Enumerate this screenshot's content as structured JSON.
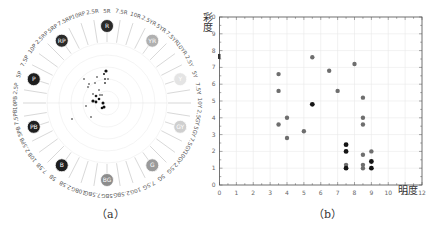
{
  "chart_data": [
    {
      "id": "a",
      "type": "polar-hue-chart",
      "caption": "（a）",
      "title": "Munsell hue ring",
      "hue_labels": [
        "5R",
        "7.5R",
        "10R",
        "2.5YR",
        "5YR",
        "7.5YR",
        "10YR",
        "2.5Y",
        "5Y",
        "7.5Y",
        "10Y",
        "2.5GY",
        "5GY",
        "7.5GY",
        "10GY",
        "2.5G",
        "5G",
        "7.5G",
        "10G",
        "2.5BG",
        "5BG",
        "7.5BG",
        "10BG",
        "2.5B",
        "5B",
        "7.5B",
        "10B",
        "2.5PB",
        "5PB",
        "7.5PB",
        "10PB",
        "2.5P",
        "5P",
        "7.5P",
        "10P",
        "2.5RP",
        "5RP",
        "7.5RP",
        "10RP",
        "2.5R"
      ],
      "hue_badges": [
        {
          "label": "R",
          "hue": "5R",
          "color": "#2a2a2a"
        },
        {
          "label": "YR",
          "hue": "5YR",
          "color": "#b0b0b0"
        },
        {
          "label": "Y",
          "hue": "5Y",
          "color": "#e4e4e4"
        },
        {
          "label": "GY",
          "hue": "5GY",
          "color": "#cfcfcf"
        },
        {
          "label": "G",
          "hue": "5G",
          "color": "#9a9a9a"
        },
        {
          "label": "BG",
          "hue": "5BG",
          "color": "#8c8c8c"
        },
        {
          "label": "B",
          "hue": "5B",
          "color": "#1e1e1e"
        },
        {
          "label": "PB",
          "hue": "5PB",
          "color": "#1e1e1e"
        },
        {
          "label": "P",
          "hue": "5P",
          "color": "#1e1e1e"
        },
        {
          "label": "RP",
          "hue": "5RP",
          "color": "#2a2a2a"
        }
      ],
      "rings": 5,
      "note": "Cluster of sample points near center, concentrated in the R / RP / YR direction"
    },
    {
      "id": "b",
      "type": "scatter",
      "caption": "（b）",
      "xlabel": "明度",
      "ylabel": "彩度",
      "xlim": [
        0,
        12
      ],
      "ylim": [
        0,
        10
      ],
      "xticks": [
        0,
        1,
        2,
        3,
        4,
        5,
        6,
        7,
        8,
        9,
        10,
        11,
        12
      ],
      "yticks": [
        0,
        1,
        2,
        3,
        4,
        5,
        6,
        7,
        8,
        9,
        10
      ],
      "grid": true,
      "series": [
        {
          "name": "gray",
          "color": "#6e6e6e",
          "points": [
            [
              3.5,
              6.6
            ],
            [
              3.5,
              5.6
            ],
            [
              3.5,
              3.6
            ],
            [
              4,
              4.0
            ],
            [
              4,
              2.8
            ],
            [
              5,
              3.2
            ],
            [
              5.5,
              7.6
            ],
            [
              6.5,
              6.8
            ],
            [
              7,
              5.6
            ],
            [
              8,
              7.2
            ],
            [
              8.5,
              5.2
            ],
            [
              8.5,
              4.0
            ],
            [
              8.5,
              3.6
            ],
            [
              8.5,
              1.8
            ],
            [
              8.5,
              1.2
            ],
            [
              8.5,
              1.0
            ],
            [
              9,
              2.0
            ],
            [
              7.5,
              1.2
            ]
          ]
        },
        {
          "name": "black",
          "color": "#151515",
          "points": [
            [
              5.5,
              4.8
            ],
            [
              7.5,
              2.4
            ],
            [
              7.5,
              2.0
            ],
            [
              7.5,
              1.0
            ],
            [
              9,
              1.4
            ],
            [
              9,
              1.0
            ]
          ]
        }
      ]
    }
  ],
  "captions": {
    "a": "（a）",
    "b": "（b）"
  },
  "axis": {
    "xlabel": "明度",
    "ylabel": "彩度"
  }
}
